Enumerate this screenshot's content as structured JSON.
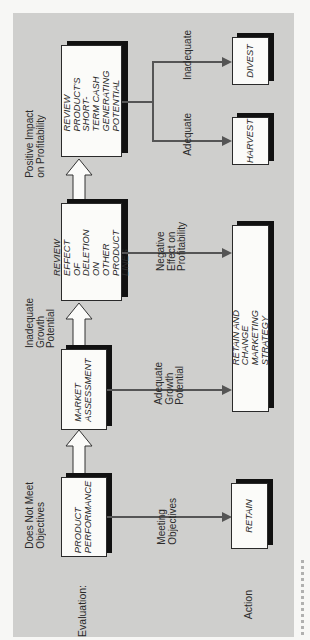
{
  "diagram": {
    "orientation": "rotated 90deg counter-clockwise (reads bottom-to-top)",
    "row_labels": {
      "evaluation": "Evaluation:",
      "action": "Action"
    },
    "evaluation_boxes": [
      {
        "id": "product-performance",
        "text": "PRODUCT\nPERFORMANCE"
      },
      {
        "id": "market-assessment",
        "text": "MARKET\nASSESSMENT"
      },
      {
        "id": "review-effect",
        "text": "REVIEW EFFECT\nOF DELETION\nON OTHER\nPRODUCT LINES"
      },
      {
        "id": "review-cash",
        "text": "REVIEW PRODUCT'S\nSHORT-TERM CASH\nGENERATING\nPOTENTIAL"
      }
    ],
    "progression_labels": [
      {
        "between": "product-performance→market-assessment",
        "text": "Does Not Meet\nObjectives"
      },
      {
        "between": "market-assessment→review-effect",
        "text": "Inadequate\nGrowth\nPotential"
      },
      {
        "between": "review-effect→review-cash",
        "text": "Positive Impact\non Profitability"
      }
    ],
    "action_boxes": [
      {
        "id": "retain",
        "text": "RETAIN"
      },
      {
        "id": "retain-change",
        "text": "RETAIN AND CHANGE\nMARKETING STRATEGY"
      },
      {
        "id": "harvest",
        "text": "HARVEST"
      },
      {
        "id": "divest",
        "text": "DIVEST"
      }
    ],
    "action_labels": [
      {
        "from": "product-performance",
        "to": "retain",
        "text": "Meeting\nObjectives"
      },
      {
        "from": "market-assessment",
        "to": "retain-change",
        "text": "Adequate\nGrowth\nPotential"
      },
      {
        "from": "review-effect",
        "to": "retain-change",
        "text": "Negative\nEffect on\nProfitability"
      },
      {
        "from": "review-cash",
        "to": "harvest",
        "text": "Adequate"
      },
      {
        "from": "review-cash",
        "to": "divest",
        "text": "Inadequate"
      }
    ]
  },
  "colors": {
    "panel": "#cfcfcd",
    "box_fill": "#fbfbf9",
    "shadow": "#111111",
    "connector": "#555555"
  }
}
